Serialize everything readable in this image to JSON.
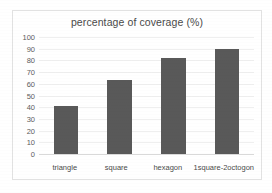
{
  "chart_data": {
    "type": "bar",
    "title": "percentage of coverage (%)",
    "xlabel": "",
    "ylabel": "",
    "categories": [
      "triangle",
      "square",
      "hexagon",
      "1square-2octogon"
    ],
    "values": [
      41,
      63,
      82,
      90
    ],
    "ylim": [
      0,
      100
    ],
    "yticks": [
      0,
      10,
      20,
      30,
      40,
      50,
      60,
      70,
      80,
      90,
      100
    ],
    "ytick_labels": [
      "0",
      "10",
      "20",
      "30",
      "40",
      "50",
      "60",
      "70",
      "80",
      "90",
      "100"
    ],
    "grid": true,
    "legend": false,
    "series": [
      {
        "name": "percentage of coverage (%)",
        "values": [
          41,
          63,
          82,
          90
        ]
      }
    ],
    "colors": {
      "bar": "#595959",
      "gridline": "#efefef",
      "axis": "#d9d9d9",
      "text": "#4a4a4a",
      "background": "#ffffff",
      "border": "#e2e2e2"
    }
  }
}
